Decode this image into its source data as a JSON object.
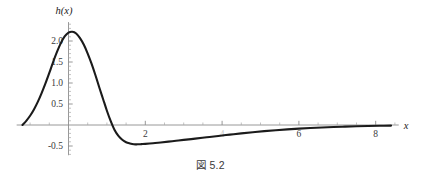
{
  "figure": {
    "caption": "図 5.2"
  },
  "chart_data": {
    "type": "line",
    "title": "",
    "xlabel": "x",
    "ylabel": "h(x)",
    "xlim": [
      -1.35,
      8.6
    ],
    "ylim": [
      -0.72,
      2.45
    ],
    "grid": false,
    "legend": "none",
    "x_ticks": [
      2,
      4,
      6,
      8
    ],
    "x_tick_labels": [
      "2",
      "4",
      "6",
      "8"
    ],
    "x_minor_step": 0.5,
    "y_ticks": [
      -0.5,
      0.5,
      1.0,
      1.5,
      2.0
    ],
    "y_tick_labels": [
      "-0.5",
      "0.5",
      "1.0",
      "1.5",
      "2.0"
    ],
    "y_minor_step": 0.1,
    "annotations": {
      "peak_x": 0.1,
      "peak_y": 2.22,
      "zero_crossing_left_x": -1.2,
      "zero_crossing_mid_x": 1.0,
      "minimum_x": 1.8,
      "minimum_y": -0.46
    },
    "series": [
      {
        "name": "h(x)",
        "points": [
          [
            -1.2,
            0.0
          ],
          [
            -1.1,
            0.1
          ],
          [
            -1.0,
            0.22
          ],
          [
            -0.9,
            0.37
          ],
          [
            -0.8,
            0.55
          ],
          [
            -0.7,
            0.76
          ],
          [
            -0.6,
            0.99
          ],
          [
            -0.5,
            1.24
          ],
          [
            -0.4,
            1.5
          ],
          [
            -0.3,
            1.74
          ],
          [
            -0.2,
            1.95
          ],
          [
            -0.1,
            2.11
          ],
          [
            0.0,
            2.2
          ],
          [
            0.1,
            2.22
          ],
          [
            0.2,
            2.18
          ],
          [
            0.3,
            2.07
          ],
          [
            0.4,
            1.91
          ],
          [
            0.5,
            1.7
          ],
          [
            0.6,
            1.46
          ],
          [
            0.7,
            1.19
          ],
          [
            0.8,
            0.9
          ],
          [
            0.9,
            0.62
          ],
          [
            1.0,
            0.34
          ],
          [
            1.1,
            0.09
          ],
          [
            1.2,
            -0.12
          ],
          [
            1.3,
            -0.26
          ],
          [
            1.4,
            -0.35
          ],
          [
            1.5,
            -0.41
          ],
          [
            1.6,
            -0.44
          ],
          [
            1.7,
            -0.46
          ],
          [
            1.8,
            -0.46
          ],
          [
            1.9,
            -0.455
          ],
          [
            2.0,
            -0.45
          ],
          [
            2.2,
            -0.435
          ],
          [
            2.4,
            -0.415
          ],
          [
            2.6,
            -0.395
          ],
          [
            2.8,
            -0.375
          ],
          [
            3.0,
            -0.355
          ],
          [
            3.3,
            -0.325
          ],
          [
            3.6,
            -0.292
          ],
          [
            3.9,
            -0.26
          ],
          [
            4.2,
            -0.23
          ],
          [
            4.5,
            -0.2
          ],
          [
            4.8,
            -0.172
          ],
          [
            5.1,
            -0.146
          ],
          [
            5.4,
            -0.124
          ],
          [
            5.7,
            -0.104
          ],
          [
            6.0,
            -0.086
          ],
          [
            6.3,
            -0.071
          ],
          [
            6.6,
            -0.058
          ],
          [
            6.9,
            -0.047
          ],
          [
            7.2,
            -0.038
          ],
          [
            7.5,
            -0.03
          ],
          [
            7.8,
            -0.024
          ],
          [
            8.1,
            -0.019
          ],
          [
            8.4,
            -0.015
          ]
        ]
      }
    ]
  }
}
